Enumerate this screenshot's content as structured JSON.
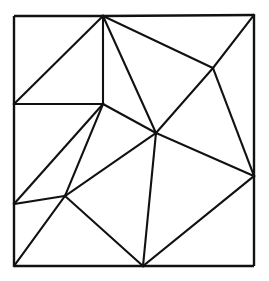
{
  "figure": {
    "background_color": "#ffffff",
    "line_color": "#111111",
    "line_width": 2.1,
    "canvas": {
      "width": 269,
      "height": 281
    },
    "vertices": [
      {
        "id": "v0",
        "name": "corner-top-left",
        "x": 14,
        "y": 16,
        "on_boundary": true
      },
      {
        "id": "v1",
        "name": "top-edge-apex",
        "x": 103,
        "y": 16,
        "on_boundary": true
      },
      {
        "id": "v2",
        "name": "corner-top-right",
        "x": 254,
        "y": 15,
        "on_boundary": true
      },
      {
        "id": "v3",
        "name": "left-edge-upper",
        "x": 14,
        "y": 104,
        "on_boundary": true
      },
      {
        "id": "v4",
        "name": "interior-upper-left",
        "x": 103,
        "y": 104,
        "on_boundary": false
      },
      {
        "id": "v5",
        "name": "interior-upper-right",
        "x": 213,
        "y": 68,
        "on_boundary": false
      },
      {
        "id": "v6",
        "name": "interior-center-hub",
        "x": 156,
        "y": 133,
        "on_boundary": false
      },
      {
        "id": "v7",
        "name": "right-edge-middle",
        "x": 254,
        "y": 176,
        "on_boundary": true
      },
      {
        "id": "v8",
        "name": "left-edge-lower",
        "x": 14,
        "y": 204,
        "on_boundary": true
      },
      {
        "id": "v9",
        "name": "interior-lower-left",
        "x": 65,
        "y": 196,
        "on_boundary": false
      },
      {
        "id": "v10",
        "name": "corner-bottom-left",
        "x": 14,
        "y": 266,
        "on_boundary": true
      },
      {
        "id": "v11",
        "name": "bottom-edge-vertex",
        "x": 143,
        "y": 266,
        "on_boundary": true
      },
      {
        "id": "v12",
        "name": "corner-bottom-right",
        "x": 254,
        "y": 266,
        "on_boundary": true
      }
    ],
    "boundary_edges": [
      {
        "name": "edge-top-left-segment",
        "from": "v0",
        "to": "v1"
      },
      {
        "name": "edge-top-right-segment",
        "from": "v1",
        "to": "v2"
      },
      {
        "name": "edge-right-upper-segment",
        "from": "v2",
        "to": "v7"
      },
      {
        "name": "edge-right-lower-segment",
        "from": "v7",
        "to": "v12"
      },
      {
        "name": "edge-bottom-right-segment",
        "from": "v12",
        "to": "v11"
      },
      {
        "name": "edge-bottom-left-segment",
        "from": "v11",
        "to": "v10"
      },
      {
        "name": "edge-left-lower-segment",
        "from": "v10",
        "to": "v8"
      },
      {
        "name": "edge-left-middle-segment",
        "from": "v8",
        "to": "v3"
      },
      {
        "name": "edge-left-upper-segment",
        "from": "v3",
        "to": "v0"
      }
    ],
    "interior_edges": [
      {
        "name": "edge-v3-v4",
        "from": "v3",
        "to": "v4"
      },
      {
        "name": "edge-v4-v1",
        "from": "v4",
        "to": "v1"
      },
      {
        "name": "edge-v3-v1",
        "from": "v3",
        "to": "v1"
      },
      {
        "name": "edge-v1-v6",
        "from": "v1",
        "to": "v6"
      },
      {
        "name": "edge-v1-v5",
        "from": "v1",
        "to": "v5"
      },
      {
        "name": "edge-v5-v2",
        "from": "v5",
        "to": "v2"
      },
      {
        "name": "edge-v5-v6",
        "from": "v5",
        "to": "v6"
      },
      {
        "name": "edge-v5-v7",
        "from": "v5",
        "to": "v7"
      },
      {
        "name": "edge-v4-v6",
        "from": "v4",
        "to": "v6"
      },
      {
        "name": "edge-v6-v7",
        "from": "v6",
        "to": "v7"
      },
      {
        "name": "edge-v4-v8",
        "from": "v4",
        "to": "v8"
      },
      {
        "name": "edge-v4-v9",
        "from": "v4",
        "to": "v9"
      },
      {
        "name": "edge-v8-v9",
        "from": "v8",
        "to": "v9"
      },
      {
        "name": "edge-v9-v6",
        "from": "v9",
        "to": "v6"
      },
      {
        "name": "edge-v9-v10",
        "from": "v9",
        "to": "v10"
      },
      {
        "name": "edge-v9-v11",
        "from": "v9",
        "to": "v11"
      },
      {
        "name": "edge-v6-v11",
        "from": "v6",
        "to": "v11"
      },
      {
        "name": "edge-v11-v7",
        "from": "v11",
        "to": "v7"
      }
    ],
    "counts": {
      "vertices": 13,
      "boundary_edges": 9,
      "interior_edges": 18
    }
  }
}
